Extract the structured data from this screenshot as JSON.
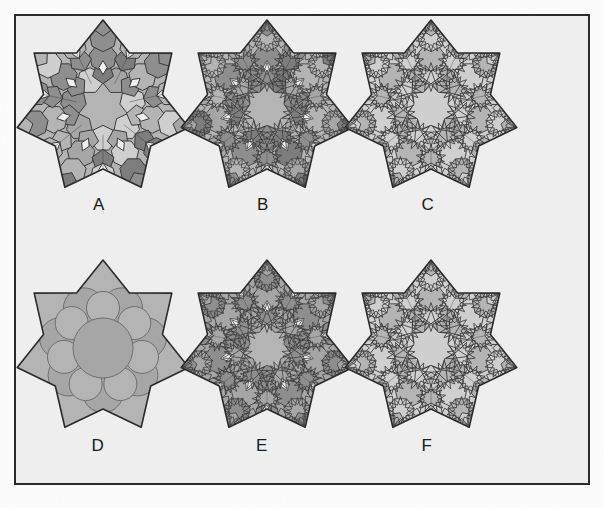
{
  "figure": {
    "kind": "plate-of-six-panels",
    "symmetry_order": 7,
    "panel_labels": [
      "A",
      "B",
      "C",
      "D",
      "E",
      "F"
    ],
    "rows": 2,
    "cols": 3,
    "frame": {
      "border_color": "#2b2b2b",
      "border_width_px": 2,
      "background_color": "#eeeeee",
      "page_background_color": "#fdfdfd",
      "x": 14,
      "y": 14,
      "width": 576,
      "height": 471
    },
    "palette": {
      "ink": "#3a3a3a",
      "ink_strong": "#2b2b2b",
      "tone_white": "#f0f0ee",
      "tone_light": "#cfcfcf",
      "tone_mid": "#b4b4b4",
      "tone_mid2": "#a6a6a6",
      "tone_dark": "#8e8e8e",
      "tone_darker": "#7d7d7d",
      "label_color": "#1a1a1a"
    },
    "panels": [
      {
        "id": "A",
        "label": "A",
        "label_x": 99,
        "label_y": 207,
        "origin_x": 8,
        "origin_y": 16,
        "style": "coarse-polygon-tiling",
        "description": "seven-pointed star outline filled with a coarse tiling of heptagons, pentagons and rhombi in several gray tones, with a large plain central disc",
        "stroke_width": 1.0,
        "rings": 3,
        "central_disc": true,
        "sub_subdivision": 1,
        "shade_variation": "high",
        "white_rhombi": true
      },
      {
        "id": "B",
        "label": "B",
        "label_x": 263,
        "label_y": 207,
        "origin_x": 172,
        "origin_y": 16,
        "style": "fine-overlay-tiling",
        "description": "same star outline with the coarse tiling overlaid by a finer interlaced star-and-rosette net",
        "stroke_width": 0.8,
        "rings": 3,
        "central_disc": true,
        "sub_subdivision": 2,
        "shade_variation": "high",
        "white_rhombi": true
      },
      {
        "id": "C",
        "label": "C",
        "label_x": 428,
        "label_y": 207,
        "origin_x": 336,
        "origin_y": 16,
        "style": "open-star-net",
        "description": "light open interlacing star polygon net, no dark cells, pale background showing through",
        "stroke_width": 0.9,
        "rings": 3,
        "central_disc": true,
        "sub_subdivision": 2,
        "shade_variation": "low",
        "white_rhombi": false
      },
      {
        "id": "D",
        "label": "D",
        "label_x": 98,
        "label_y": 448,
        "origin_x": 8,
        "origin_y": 256,
        "style": "circle-packing",
        "description": "seven-pointed star filled with a packing of discs: one large central disc, a ring of seven large discs and seven smaller discs toward the points",
        "stroke_width": 1.0,
        "rings": 3,
        "central_disc": true,
        "sub_subdivision": 1,
        "shade_variation": "low",
        "white_rhombi": false
      },
      {
        "id": "E",
        "label": "E",
        "label_x": 262,
        "label_y": 448,
        "origin_x": 172,
        "origin_y": 256,
        "style": "dense-overlay-tiling",
        "description": "darkest panel: dense interlaced net of stars and kites over a mid-gray ground with small white arrow shaped gaps",
        "stroke_width": 0.8,
        "rings": 3,
        "central_disc": true,
        "sub_subdivision": 2,
        "shade_variation": "medium",
        "white_rhombi": true
      },
      {
        "id": "F",
        "label": "F",
        "label_x": 427,
        "label_y": 448,
        "origin_x": 336,
        "origin_y": 256,
        "style": "open-star-net",
        "description": "light open star polygon net similar to C with slightly denser sub cells",
        "stroke_width": 0.9,
        "rings": 3,
        "central_disc": true,
        "sub_subdivision": 2,
        "shade_variation": "low",
        "white_rhombi": false
      }
    ],
    "star_outline": {
      "points": 7,
      "outer_radius": 88,
      "inner_radius": 61,
      "center_x": 95,
      "center_y": 92,
      "rotation_deg": -90,
      "stroke_color": "#2b2b2b",
      "stroke_width": 1.6,
      "fill": "#c9c9c9"
    }
  }
}
